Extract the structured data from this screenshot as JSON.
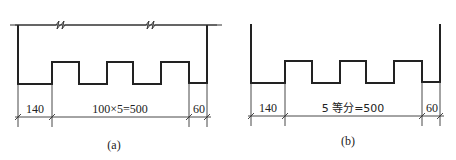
{
  "figures": [
    {
      "id": "a",
      "caption": "(a)",
      "dimensions": {
        "left": "140",
        "middle": "100×5=500",
        "right": "60"
      }
    },
    {
      "id": "b",
      "caption": "(b)",
      "dimensions": {
        "left": "140",
        "middle": "5 等分=500",
        "right": "60"
      }
    }
  ]
}
